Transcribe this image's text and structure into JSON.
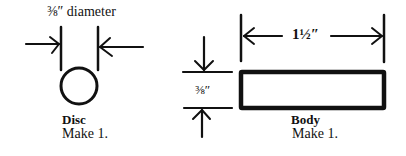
{
  "disc": {
    "dimension_label": "⅜″ diameter",
    "name": "Disc",
    "quantity": "Make 1."
  },
  "body": {
    "width_label": "1½″",
    "height_label": "⅜″",
    "name": "Body",
    "quantity": "Make 1."
  },
  "colors": {
    "ink": "#111111",
    "background": "#ffffff"
  }
}
